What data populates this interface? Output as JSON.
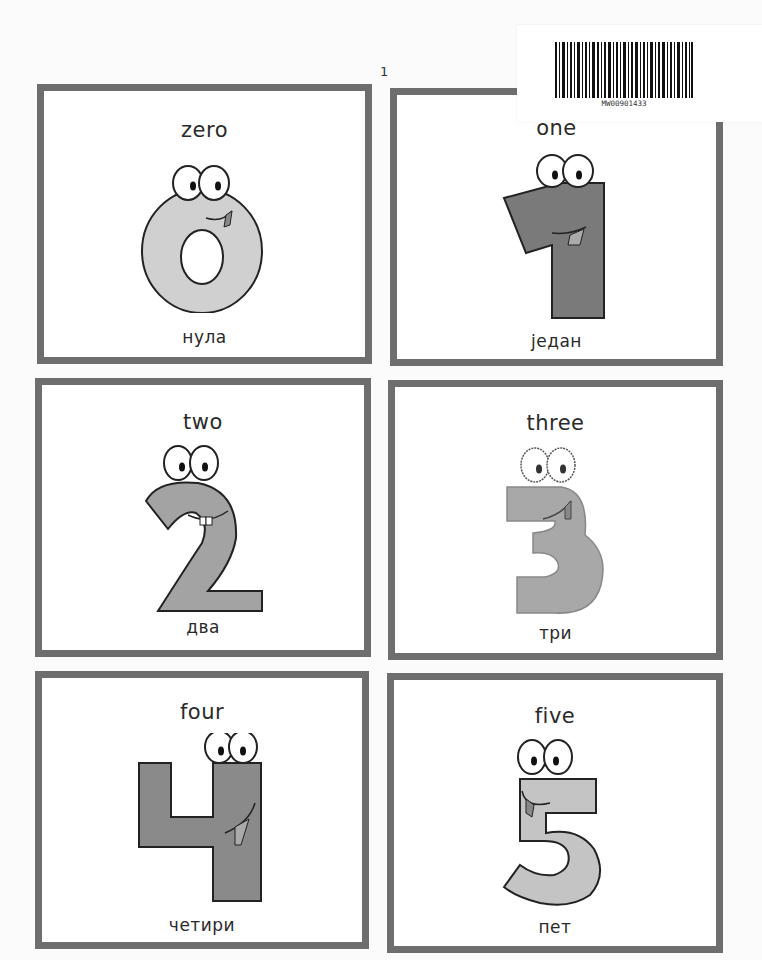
{
  "page": {
    "page_number": "1",
    "border_color": "#6e6e6e",
    "background": "#ffffff"
  },
  "barcode": {
    "code": "MW00901433"
  },
  "cards": [
    {
      "number": 0,
      "english": "zero",
      "serbian": "нула",
      "icon": "cartoon-zero-icon",
      "fill": "#d0d0d0"
    },
    {
      "number": 1,
      "english": "one",
      "serbian": "један",
      "icon": "cartoon-one-icon",
      "fill": "#7a7a7a"
    },
    {
      "number": 2,
      "english": "two",
      "serbian": "два",
      "icon": "cartoon-two-icon",
      "fill": "#a3a3a3"
    },
    {
      "number": 3,
      "english": "three",
      "serbian": "три",
      "icon": "cartoon-three-icon",
      "fill": "#a8a8a8"
    },
    {
      "number": 4,
      "english": "four",
      "serbian": "четири",
      "icon": "cartoon-four-icon",
      "fill": "#8a8a8a"
    },
    {
      "number": 5,
      "english": "five",
      "serbian": "пет",
      "icon": "cartoon-five-icon",
      "fill": "#c4c4c4"
    }
  ]
}
